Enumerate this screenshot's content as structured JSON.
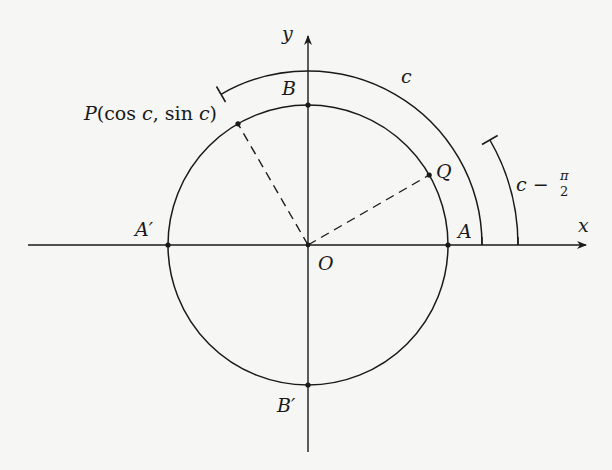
{
  "figure": {
    "colors": {
      "background": "#f6f6f4",
      "ink": "#1a1a1a"
    },
    "geometry": {
      "origin": [
        308,
        245
      ],
      "radius": 140,
      "arc_c_radius": 174,
      "arc_c_minus_half_pi_radius": 210,
      "angle_c_deg": 120,
      "angle_c_minus_half_pi_deg": 30
    },
    "labels": {
      "x_axis": "x",
      "y_axis": "y",
      "origin": "O",
      "A": "A",
      "A_prime": "A′",
      "B": "B",
      "B_prime": "B′",
      "P_name": "P",
      "P_coords": "(cos c, sin c)",
      "P_open": "(cos ",
      "P_c1": "c",
      "P_mid": ", sin ",
      "P_c2": "c",
      "P_close": ")",
      "Q": "Q",
      "arc_c": "c",
      "arc_c_minus_prefix": "c −",
      "pi": "π",
      "two": "2"
    }
  }
}
